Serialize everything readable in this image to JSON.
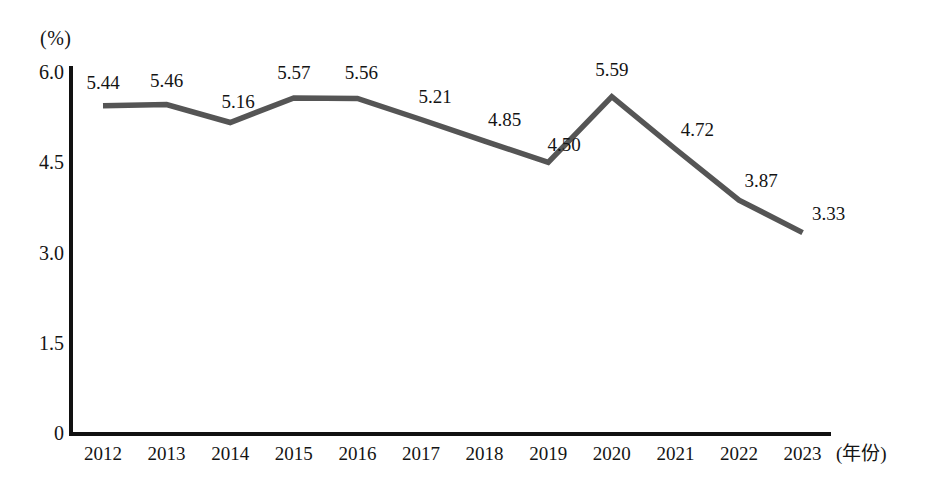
{
  "chart_data": {
    "type": "line",
    "title": "",
    "subtitle": "",
    "xlabel": "(年份)",
    "ylabel": "(%)",
    "categories": [
      "2012",
      "2013",
      "2014",
      "2015",
      "2016",
      "2017",
      "2018",
      "2019",
      "2020",
      "2021",
      "2022",
      "2023"
    ],
    "values": [
      5.44,
      5.46,
      5.16,
      5.57,
      5.56,
      5.21,
      4.85,
      4.5,
      5.59,
      4.72,
      3.87,
      3.33
    ],
    "value_labels": [
      "5.44",
      "5.46",
      "5.16",
      "5.57",
      "5.56",
      "5.21",
      "4.85",
      "4.50",
      "5.59",
      "4.72",
      "3.87",
      "3.33"
    ],
    "series": [
      {
        "name": "",
        "values": [
          5.44,
          5.46,
          5.16,
          5.57,
          5.56,
          5.21,
          4.85,
          4.5,
          5.59,
          4.72,
          3.87,
          3.33
        ],
        "color": "#555555"
      }
    ],
    "ylim": [
      0,
      6.0
    ],
    "yticks": [
      "0",
      "1.5",
      "3.0",
      "4.5",
      "6.0"
    ],
    "ytick_values": [
      0,
      1.5,
      3.0,
      4.5,
      6.0
    ],
    "grid": false,
    "legend": false,
    "legend_position": "none",
    "line_color": "#555555",
    "axis_color": "#111111",
    "background_color": "#ffffff"
  },
  "axes": {
    "y_unit": "(%)",
    "x_unit": "(年份)"
  }
}
